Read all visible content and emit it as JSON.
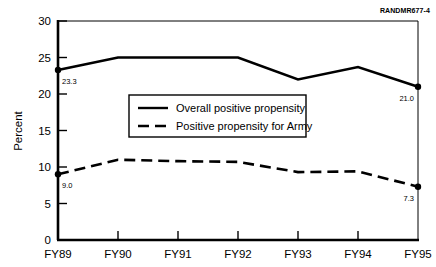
{
  "figure": {
    "identifier_bold": "RAND",
    "identifier_rest": "MR677-4"
  },
  "chart_data": {
    "type": "line",
    "title": "",
    "xlabel": "",
    "ylabel": "Percent",
    "categories": [
      "FY89",
      "FY90",
      "FY91",
      "FY92",
      "FY93",
      "FY94",
      "FY95"
    ],
    "ylim": [
      0,
      30
    ],
    "yticks": [
      0,
      5,
      10,
      15,
      20,
      25,
      30
    ],
    "ytick_labels": [
      "0",
      "5",
      "10",
      "15",
      "20",
      "25",
      "30"
    ],
    "grid": false,
    "legend_position": "center",
    "series": [
      {
        "name": "Overall positive propensity",
        "style": "solid",
        "values": [
          23.3,
          25.0,
          25.0,
          25.0,
          22.0,
          23.7,
          21.0
        ],
        "endpoint_labels": {
          "first": "23.3",
          "last": "21.0"
        }
      },
      {
        "name": "Positive propensity for Army",
        "style": "dashed",
        "values": [
          9.0,
          11.0,
          10.8,
          10.7,
          9.3,
          9.4,
          7.3
        ],
        "endpoint_labels": {
          "first": "9.0",
          "last": "7.3"
        }
      }
    ]
  },
  "legend": {
    "items": [
      {
        "label": "Overall positive propensity",
        "style": "solid"
      },
      {
        "label": "Positive propensity for Army",
        "style": "dashed"
      }
    ]
  },
  "colors": {
    "line": "#000000",
    "axis": "#000000",
    "background": "#ffffff"
  }
}
